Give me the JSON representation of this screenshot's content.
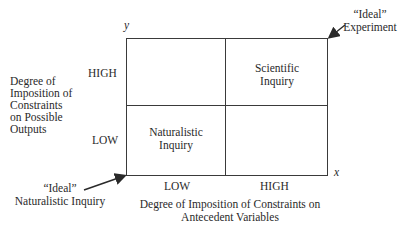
{
  "diagram": {
    "axes": {
      "y_label": "y",
      "x_label": "x",
      "y_title": [
        "Degree of",
        "Imposition of",
        "Constraints",
        "on Possible",
        "Outputs"
      ],
      "x_title": [
        "Degree of Imposition of Constraints on",
        "Antecedent Variables"
      ],
      "y_ticks": {
        "high": "HIGH",
        "low": "LOW"
      },
      "x_ticks": {
        "low": "LOW",
        "high": "HIGH"
      }
    },
    "quadrants": {
      "top_right": [
        "Scientific",
        "Inquiry"
      ],
      "bottom_left": [
        "Naturalistic",
        "Inquiry"
      ]
    },
    "annotations": {
      "ideal_experiment": [
        "“Ideal”",
        "Experiment"
      ],
      "ideal_naturalistic": [
        "“Ideal”",
        "Naturalistic Inquiry"
      ]
    },
    "colors": {
      "line": "#3a3a3a",
      "text": "#2a2a2a",
      "background": "#ffffff"
    }
  }
}
